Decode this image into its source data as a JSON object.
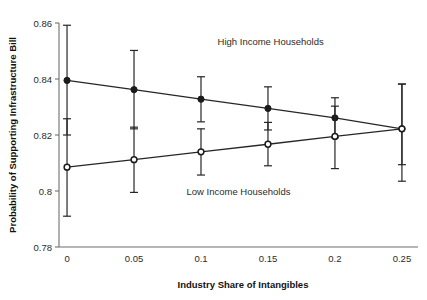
{
  "chart_data": {
    "type": "line",
    "title": "",
    "xlabel": "Industry Share of Intangibles",
    "ylabel": "Probability of Supporting Infrastructure Bill",
    "x": [
      0,
      0.05,
      0.1,
      0.15,
      0.2,
      0.25
    ],
    "xtick_labels": [
      "0",
      "0.05",
      "0.1",
      "0.15",
      "0.2",
      "0.25"
    ],
    "ytick_labels": [
      "0.78",
      "0.8",
      "0.82",
      "0.84",
      "0.86"
    ],
    "ytick_values": [
      0.78,
      0.8,
      0.82,
      0.84,
      0.86
    ],
    "xlim": [
      -0.006,
      0.262
    ],
    "ylim": [
      0.78,
      0.86
    ],
    "grid": false,
    "legend": "annotations-inline",
    "series": [
      {
        "name": "High Income Households",
        "marker": "filled-circle",
        "values": [
          0.8395,
          0.8362,
          0.8328,
          0.8295,
          0.8261,
          0.8222
        ],
        "ci_low": [
          0.82,
          0.8222,
          0.8247,
          0.8218,
          0.819,
          0.8094
        ],
        "ci_high": [
          0.8592,
          0.8502,
          0.8408,
          0.8372,
          0.8333,
          0.8382
        ]
      },
      {
        "name": "Low Income Households",
        "marker": "open-circle",
        "values": [
          0.8085,
          0.8112,
          0.814,
          0.8167,
          0.8195,
          0.8222
        ],
        "ci_low": [
          0.791,
          0.7995,
          0.8057,
          0.809,
          0.808,
          0.8035
        ],
        "ci_high": [
          0.8258,
          0.8228,
          0.8222,
          0.8245,
          0.8303,
          0.8382
        ]
      }
    ],
    "annotations": [
      {
        "text": "High Income Households",
        "x": 0.152,
        "y": 0.852
      },
      {
        "text": "Low Income Households",
        "x": 0.128,
        "y": 0.7985
      }
    ]
  }
}
